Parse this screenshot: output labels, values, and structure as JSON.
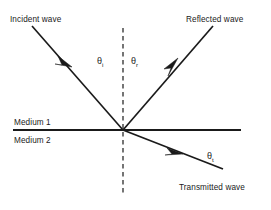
{
  "diagram": {
    "background_color": "#ffffff",
    "line_color": "#1a1a1a",
    "labels": {
      "incident_wave": "Incident wave",
      "reflected_wave": "Reflected wave",
      "transmitted_wave": "Transmitted wave",
      "medium_upper": "Medium 1",
      "medium_lower": "Medium 2"
    },
    "angles": {
      "incident": {
        "symbol": "θ",
        "subscript": "i"
      },
      "reflected": {
        "symbol": "θ",
        "subscript": "r"
      },
      "transmitted": {
        "symbol": "θ",
        "subscript": "t"
      }
    },
    "geometry": {
      "origin": {
        "x": 123,
        "y": 130
      },
      "incident_ray": {
        "x1": 32,
        "y1": 26,
        "x2": 123,
        "y2": 130
      },
      "reflected_ray": {
        "x1": 123,
        "y1": 130,
        "x2": 213,
        "y2": 26
      },
      "transmitted_ray": {
        "x1": 123,
        "y1": 130,
        "x2": 223,
        "y2": 169
      },
      "interface_line": {
        "x1": 13,
        "y1": 130,
        "x2": 241,
        "y2": 130
      },
      "normal_line": {
        "x1": 123,
        "y1": 28,
        "x2": 123,
        "y2": 196
      }
    }
  }
}
